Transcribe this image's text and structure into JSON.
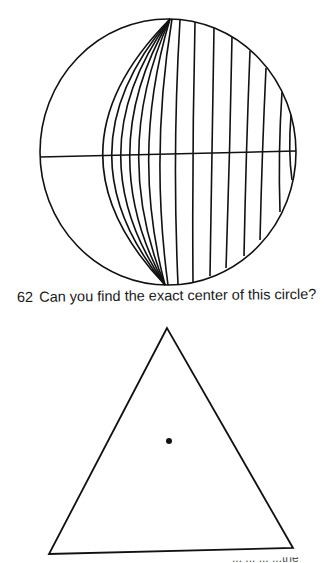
{
  "page": {
    "background": "#ffffff",
    "ink_color": "#111111"
  },
  "figure_62": {
    "number": "62",
    "caption": "Can you find the exact center of this circle?",
    "circle": {
      "cx": 168,
      "cy": 152,
      "rx": 128,
      "ry": 133
    },
    "diameter_line": {
      "x1": 40,
      "y1": 157,
      "x2": 296,
      "y2": 151
    },
    "arc_count": 14
  },
  "figure_63": {
    "triangle": {
      "apex": [
        167,
        328
      ],
      "bottom_left": [
        49,
        554
      ],
      "bottom_right": [
        293,
        548
      ]
    },
    "dot": {
      "cx": 169,
      "cy": 441,
      "r": 3
    }
  },
  "cutoff_text": "... ... ... ...the"
}
